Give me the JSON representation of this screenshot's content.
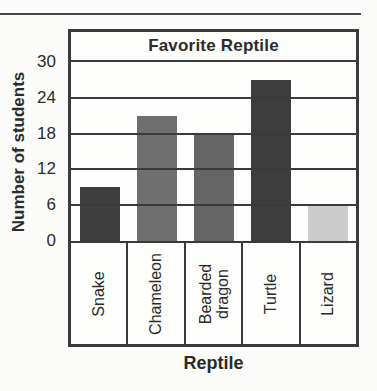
{
  "chart_data": {
    "type": "bar",
    "title": "Favorite Reptile",
    "xlabel": "Reptile",
    "ylabel": "Number of students",
    "categories": [
      "Snake",
      "Chameleon",
      "Bearded dragon",
      "Turtle",
      "Lizard"
    ],
    "values": [
      9,
      21,
      18,
      27,
      6
    ],
    "bar_colors": [
      "#3e3e3e",
      "#6f6f6f",
      "#656565",
      "#3d3d3d",
      "#cccccc"
    ],
    "yticks": [
      30,
      24,
      18,
      12,
      6,
      0
    ],
    "ylim": [
      0,
      30
    ],
    "grid": true,
    "legend": false,
    "frame_color": "#3a3a3a",
    "background_color": "#fbfbf9"
  }
}
